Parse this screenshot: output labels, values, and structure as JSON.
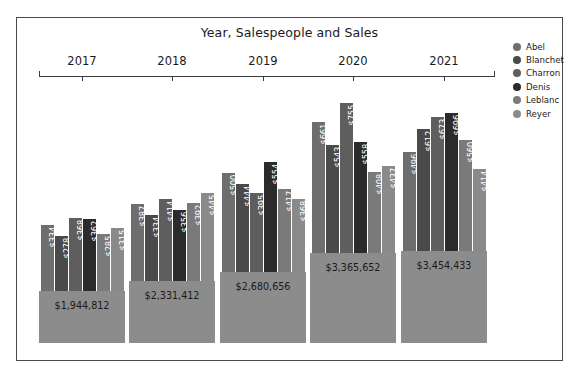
{
  "chart_data": {
    "type": "bar",
    "title": "Year, Salespeople and Sales",
    "xlabel": "",
    "ylabel": "",
    "grid": false,
    "legend_position": "right",
    "categories": [
      "2017",
      "2018",
      "2019",
      "2020",
      "2021"
    ],
    "series": [
      {
        "name": "Abel",
        "values": [
          334915,
          387531,
          500597,
          661832,
          496746
        ]
      },
      {
        "name": "Blanchet",
        "values": [
          278519,
          334486,
          444128,
          543485,
          612498
        ]
      },
      {
        "name": "Charron",
        "values": [
          368127,
          414859,
          395977,
          755892,
          673496
        ]
      },
      {
        "name": "Denis",
        "values": [
          362843,
          356480,
          554671,
          558139,
          696204
        ]
      },
      {
        "name": "Leblanc",
        "values": [
          285395,
          392570,
          417058,
          408710,
          560592
        ]
      },
      {
        "name": "Reyer",
        "values": [
          315013,
          445486,
          368225,
          437594,
          414897
        ]
      }
    ],
    "totals": [
      1944812,
      2331412,
      2680656,
      3365652,
      3454433
    ],
    "totals_formatted": [
      "$1,944,812",
      "$2,331,412",
      "$2,680,656",
      "$3,365,652",
      "$3,454,433"
    ],
    "bar_labels": [
      [
        "$334,915",
        "$278,519",
        "$368,127",
        "$362,843",
        "$285,395",
        "$315,013"
      ],
      [
        "$387,531",
        "$334,486",
        "$414,859",
        "$356,480",
        "$392,570",
        "$445,486"
      ],
      [
        "$500,597",
        "$444,128",
        "$395,977",
        "$554,671",
        "$417,058",
        "$368,225"
      ],
      [
        "$661,832",
        "$543,485",
        "$755,892",
        "$558,139",
        "$408,710",
        "$437,594"
      ],
      [
        "$496,746",
        "$612,498",
        "$673,496",
        "$696,204",
        "$560,592",
        "$414,897"
      ]
    ],
    "series_colors": [
      "#6e6e6e",
      "#4a4a4a",
      "#5e5e5e",
      "#2b2b2b",
      "#7a7a7a",
      "#8a8a8a"
    ],
    "total_panel_color": "#8c8c8c",
    "axis_color": "#3a3a3a",
    "frame_color": "#4a4a4a"
  },
  "legend": {
    "items": [
      {
        "label": "Abel",
        "color": "#6e6e6e"
      },
      {
        "label": "Blanchet",
        "color": "#4a4a4a"
      },
      {
        "label": "Charron",
        "color": "#5e5e5e"
      },
      {
        "label": "Denis",
        "color": "#2b2b2b"
      },
      {
        "label": "Leblanc",
        "color": "#7a7a7a"
      },
      {
        "label": "Reyer",
        "color": "#8a8a8a"
      }
    ]
  }
}
